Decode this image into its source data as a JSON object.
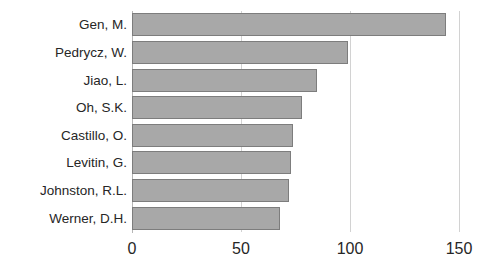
{
  "chart_data": {
    "type": "bar",
    "orientation": "horizontal",
    "title": "",
    "subtitle": "",
    "xlabel": "",
    "ylabel": "",
    "categories": [
      "Gen, M.",
      "Pedrycz, W.",
      "Jiao, L.",
      "Oh, S.K.",
      "Castillo, O.",
      "Levitin, G.",
      "Johnston, R.L.",
      "Werner, D.H."
    ],
    "values": [
      144,
      99,
      85,
      78,
      74,
      73,
      72,
      68
    ],
    "series": [
      {
        "name": "",
        "values": [
          144,
          99,
          85,
          78,
          74,
          73,
          72,
          68
        ]
      }
    ],
    "xlim": [
      0,
      150
    ],
    "xticks": [
      0,
      50,
      100,
      150
    ],
    "xtick_labels": [
      "0",
      "50",
      "100",
      "150"
    ],
    "grid": true,
    "grid_axis": "x",
    "legend": false,
    "legend_position": "none",
    "annotations": [],
    "data_labels": false,
    "colors": {
      "bar_fill": "#a8a8a8",
      "bar_border": "#7d7d7d",
      "gridline": "#d2d2d2",
      "axis_line": "#b6b6b6",
      "text": "#262626",
      "background": "#ffffff"
    }
  }
}
